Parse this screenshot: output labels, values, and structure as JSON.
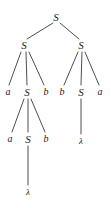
{
  "figure": {
    "kind": "parse-tree",
    "width": 111,
    "height": 208,
    "background_color": "#ffffff",
    "edge_color": "#3a3a3a",
    "text_color": "#1c1c1c"
  },
  "nodes": [
    {
      "id": "n0",
      "label": "S",
      "type": "nonterminal",
      "x": 56,
      "y": 17,
      "level": 0
    },
    {
      "id": "n1",
      "label": "S",
      "type": "nonterminal",
      "x": 24,
      "y": 45,
      "level": 1
    },
    {
      "id": "n2",
      "label": "S",
      "type": "nonterminal",
      "x": 81,
      "y": 45,
      "level": 1
    },
    {
      "id": "n3",
      "label": "a",
      "type": "terminal",
      "x": 8,
      "y": 92,
      "level": 2
    },
    {
      "id": "n4",
      "label": "S",
      "type": "nonterminal",
      "x": 27,
      "y": 92,
      "level": 2
    },
    {
      "id": "n5",
      "label": "b",
      "type": "terminal",
      "x": 46,
      "y": 92,
      "level": 2
    },
    {
      "id": "n6",
      "label": "b",
      "type": "terminal",
      "x": 62,
      "y": 92,
      "level": 2
    },
    {
      "id": "n7",
      "label": "S",
      "type": "nonterminal",
      "x": 81,
      "y": 92,
      "level": 2
    },
    {
      "id": "n8",
      "label": "a",
      "type": "terminal",
      "x": 100,
      "y": 92,
      "level": 2
    },
    {
      "id": "n9",
      "label": "a",
      "type": "terminal",
      "x": 10,
      "y": 139,
      "level": 3
    },
    {
      "id": "n10",
      "label": "S",
      "type": "nonterminal",
      "x": 28,
      "y": 139,
      "level": 3
    },
    {
      "id": "n11",
      "label": "b",
      "type": "terminal",
      "x": 46,
      "y": 139,
      "level": 3
    },
    {
      "id": "n12",
      "label": "λ",
      "type": "lambda",
      "x": 81,
      "y": 141,
      "level": 3
    },
    {
      "id": "n13",
      "label": "λ",
      "type": "lambda",
      "x": 28,
      "y": 192,
      "level": 4
    }
  ],
  "edges": [
    {
      "from": "n0",
      "to": "n1",
      "x1": 53,
      "y1": 23,
      "x2": 27,
      "y2": 39
    },
    {
      "from": "n0",
      "to": "n2",
      "x1": 60,
      "y1": 23,
      "x2": 79,
      "y2": 39
    },
    {
      "from": "n1",
      "to": "n3",
      "x1": 21,
      "y1": 52,
      "x2": 9,
      "y2": 85
    },
    {
      "from": "n1",
      "to": "n4",
      "x1": 26,
      "y1": 52,
      "x2": 27,
      "y2": 85
    },
    {
      "from": "n1",
      "to": "n5",
      "x1": 29,
      "y1": 52,
      "x2": 44,
      "y2": 85
    },
    {
      "from": "n2",
      "to": "n6",
      "x1": 78,
      "y1": 52,
      "x2": 64,
      "y2": 85
    },
    {
      "from": "n2",
      "to": "n7",
      "x1": 82,
      "y1": 52,
      "x2": 81,
      "y2": 85
    },
    {
      "from": "n2",
      "to": "n8",
      "x1": 85,
      "y1": 52,
      "x2": 99,
      "y2": 85
    },
    {
      "from": "n4",
      "to": "n9",
      "x1": 24,
      "y1": 99,
      "x2": 12,
      "y2": 132
    },
    {
      "from": "n4",
      "to": "n10",
      "x1": 28,
      "y1": 99,
      "x2": 28,
      "y2": 132
    },
    {
      "from": "n4",
      "to": "n11",
      "x1": 31,
      "y1": 99,
      "x2": 45,
      "y2": 132
    },
    {
      "from": "n7",
      "to": "n12",
      "x1": 81,
      "y1": 99,
      "x2": 81,
      "y2": 134
    },
    {
      "from": "n10",
      "to": "n13",
      "x1": 28,
      "y1": 146,
      "x2": 28,
      "y2": 185
    }
  ],
  "yield": "a a b b b a",
  "symbols": {
    "start_symbol": "S",
    "terminals": [
      "a",
      "b"
    ],
    "empty_string": "λ"
  }
}
